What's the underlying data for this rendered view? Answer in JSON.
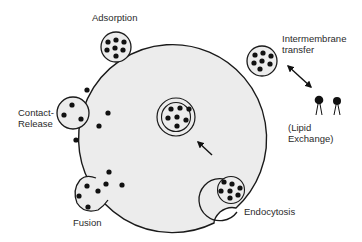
{
  "diagram": {
    "labels": {
      "adsorption": "Adsorption",
      "intermembrane_line1": "Intermembrane",
      "intermembrane_line2": "transfer",
      "contact_line1": "Contact-",
      "contact_line2": "Release",
      "lipid_line1": "(Lipid",
      "lipid_line2": "Exchange)",
      "fusion": "Fusion",
      "endocytosis": "Endocytosis"
    },
    "colors": {
      "cell_fill": "#ececec",
      "outline": "#1a1a1a",
      "dot": "#111111",
      "background": "#ffffff"
    }
  }
}
